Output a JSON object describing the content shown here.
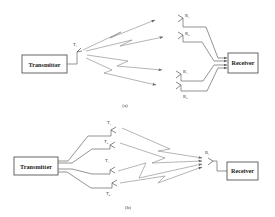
{
  "diagram_a": {
    "transmitter_label": "Transmitter",
    "receiver_label": "Receiver",
    "transmit_antenna": {
      "label": "T",
      "sub": "1"
    },
    "receive_antennas": [
      {
        "label": "R",
        "sub": "1"
      },
      {
        "label": "R",
        "sub": "2"
      },
      {
        "label": "R",
        "sub": "3"
      },
      {
        "label": "R",
        "sub": "4"
      }
    ],
    "caption": "(a)"
  },
  "diagram_b": {
    "transmitter_label": "Transmitter",
    "receiver_label": "Receiver",
    "transmit_antennas": [
      {
        "label": "T",
        "sub": "1"
      },
      {
        "label": "T",
        "sub": "2"
      },
      {
        "label": "T",
        "sub": "3"
      },
      {
        "label": "T",
        "sub": "4"
      }
    ],
    "receive_antenna": {
      "label": "R",
      "sub": "1"
    },
    "caption": "(b)"
  }
}
